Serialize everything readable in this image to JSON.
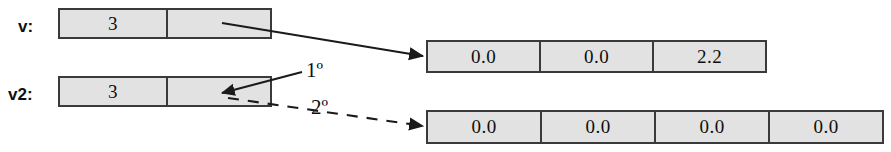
{
  "diagram": {
    "background_color": "#ffffff",
    "box_fill_color": "#e2e2e2",
    "box_border_color": "#3a3a3a",
    "line_color": "#1a1a1a"
  },
  "variables": [
    {
      "name": "v-record",
      "label": "v:",
      "cells": [
        {
          "name": "length-cell",
          "value": "3"
        },
        {
          "name": "reference-cell",
          "value": ""
        }
      ]
    },
    {
      "name": "v2-record",
      "label": "v2:",
      "cells": [
        {
          "name": "length-cell",
          "value": "3"
        },
        {
          "name": "reference-cell",
          "value": ""
        }
      ]
    }
  ],
  "arrays": [
    {
      "name": "array-top",
      "values": [
        "0.0",
        "0.0",
        "2.2"
      ]
    },
    {
      "name": "array-bottom",
      "values": [
        "0.0",
        "0.0",
        "0.0",
        "0.0"
      ]
    }
  ],
  "annotations": [
    {
      "name": "ordinal-first",
      "label": "1º"
    },
    {
      "name": "ordinal-second",
      "label": "2º"
    }
  ],
  "connectors": [
    {
      "name": "solid-pointer-to-top-array",
      "style": "solid",
      "from": "v reference cell",
      "to": "array-top"
    },
    {
      "name": "solid-pointer-into-v2",
      "style": "solid",
      "from": "ordinal-first",
      "to": "v2 reference cell"
    },
    {
      "name": "dashed-pointer-to-bottom-array",
      "style": "dashed",
      "from": "v2 reference cell",
      "to": "array-bottom"
    }
  ]
}
